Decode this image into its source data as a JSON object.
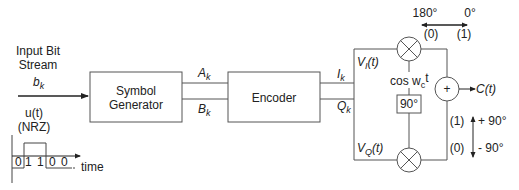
{
  "diagram": {
    "input": {
      "label_line1": "Input Bit",
      "label_line2": "Stream",
      "symbol": "b",
      "symbol_sub": "k"
    },
    "nrz": {
      "label_line1": "u(t)",
      "label_line2": "(NRZ)",
      "bits": [
        "0",
        "1",
        "1",
        "0",
        "0"
      ],
      "axis_label": "time"
    },
    "blocks": {
      "symbol_generator_line1": "Symbol",
      "symbol_generator_line2": "Generator",
      "encoder": "Encoder",
      "phase_shift": "90°"
    },
    "signals": {
      "a": "A",
      "a_sub": "k",
      "b": "B",
      "b_sub": "k",
      "i": "I",
      "i_sub": "k",
      "q": "Q",
      "q_sub": "k",
      "vi": "V",
      "vi_sub": "I",
      "vi_arg": "(t)",
      "vq": "V",
      "vq_sub": "Q",
      "vq_arg": "(t)",
      "carrier": "cos w",
      "carrier_sub": "c",
      "carrier_t": "t",
      "output": "C(t)",
      "sum": "+"
    },
    "phase_legend": {
      "horizontal": {
        "left_deg": "180°",
        "right_deg": "0°",
        "left_bit": "(0)",
        "right_bit": "(1)"
      },
      "vertical": {
        "up_bit": "(1)",
        "up_deg": "+ 90°",
        "down_bit": "(0)",
        "down_deg": "- 90°"
      }
    }
  }
}
